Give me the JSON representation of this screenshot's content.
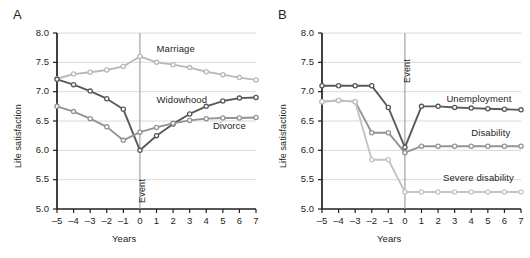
{
  "figure": {
    "panels": [
      {
        "letter": "A",
        "xlabel": "Years",
        "ylabel": "Life satisfaction",
        "event_label": "Event",
        "event_label_position": "bottom"
      },
      {
        "letter": "B",
        "xlabel": "Years",
        "ylabel": "Life satisfaction",
        "event_label": "Event",
        "event_label_position": "top"
      }
    ]
  },
  "chart_data": [
    {
      "type": "line",
      "panel": "A",
      "title": "",
      "xlabel": "Years",
      "ylabel": "Life satisfaction",
      "x": [
        -5,
        -4,
        -3,
        -2,
        -1,
        0,
        1,
        2,
        3,
        4,
        5,
        6,
        7
      ],
      "xlim": [
        -5,
        7
      ],
      "ylim": [
        5.0,
        8.0
      ],
      "yticks": [
        "5.0",
        "5.5",
        "6.0",
        "6.5",
        "7.0",
        "7.5",
        "8.0"
      ],
      "xticks": [
        "–5",
        "–4",
        "–3",
        "–2",
        "–1",
        "0",
        "1",
        "2",
        "3",
        "4",
        "5",
        "6",
        "7"
      ],
      "grid": true,
      "legend": "inline-annotations",
      "annotations": [
        {
          "text": "Marriage",
          "x": 1.0,
          "y": 7.72
        },
        {
          "text": "Widowhood",
          "x": 1.0,
          "y": 6.86
        },
        {
          "text": "Divorce",
          "x": 4.4,
          "y": 6.42
        }
      ],
      "event_marker": {
        "x": 0,
        "label": "Event"
      },
      "series": [
        {
          "name": "Marriage",
          "color": "#b9b9b9",
          "values": [
            7.22,
            7.3,
            7.33,
            7.37,
            7.43,
            7.6,
            7.5,
            7.46,
            7.41,
            7.34,
            7.29,
            7.24,
            7.2
          ]
        },
        {
          "name": "Widowhood",
          "color": "#58595b",
          "values": [
            7.21,
            7.12,
            7.01,
            6.88,
            6.7,
            6.0,
            6.25,
            6.45,
            6.62,
            6.75,
            6.84,
            6.89,
            6.9
          ]
        },
        {
          "name": "Divorce",
          "color": "#939393",
          "values": [
            6.75,
            6.66,
            6.54,
            6.4,
            6.17,
            6.31,
            6.39,
            6.46,
            6.51,
            6.54,
            6.55,
            6.55,
            6.56
          ]
        }
      ]
    },
    {
      "type": "line",
      "panel": "B",
      "title": "",
      "xlabel": "Years",
      "ylabel": "Life satisfaction",
      "x": [
        -5,
        -4,
        -3,
        -2,
        -1,
        0,
        1,
        2,
        3,
        4,
        5,
        6,
        7
      ],
      "xlim": [
        -5,
        7
      ],
      "ylim": [
        5.0,
        8.0
      ],
      "yticks": [
        "5.0",
        "5.5",
        "6.0",
        "6.5",
        "7.0",
        "7.5",
        "8.0"
      ],
      "xticks": [
        "–5",
        "–4",
        "–3",
        "–2",
        "–1",
        "0",
        "1",
        "2",
        "3",
        "4",
        "5",
        "6",
        "7"
      ],
      "grid": true,
      "legend": "inline-annotations",
      "annotations": [
        {
          "text": "Unemployment",
          "x": 2.5,
          "y": 6.88
        },
        {
          "text": "Disability",
          "x": 4.0,
          "y": 6.3
        },
        {
          "text": "Severe disability",
          "x": 2.3,
          "y": 5.52
        }
      ],
      "event_marker": {
        "x": 0,
        "label": "Event"
      },
      "series": [
        {
          "name": "Unemployment",
          "color": "#58595b",
          "values": [
            7.1,
            7.1,
            7.1,
            7.1,
            6.73,
            6.05,
            6.75,
            6.75,
            6.73,
            6.72,
            6.71,
            6.7,
            6.69
          ]
        },
        {
          "name": "Disability",
          "color": "#939393",
          "values": [
            6.83,
            6.85,
            6.83,
            6.3,
            6.3,
            5.96,
            6.07,
            6.07,
            6.07,
            6.07,
            6.07,
            6.07,
            6.07
          ]
        },
        {
          "name": "Severe disability",
          "color": "#c4c4c4",
          "values": [
            6.83,
            6.85,
            6.83,
            5.84,
            5.84,
            5.29,
            5.29,
            5.29,
            5.29,
            5.29,
            5.29,
            5.29,
            5.29
          ]
        }
      ]
    }
  ]
}
